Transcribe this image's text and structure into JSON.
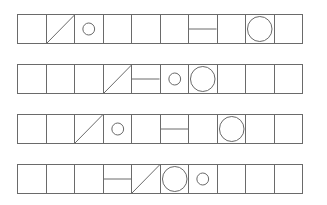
{
  "diagram": {
    "stroke_color": "#6a6a6a",
    "rows": [
      {
        "cells": [
          "empty",
          "diagonal",
          "small-circle",
          "empty",
          "empty",
          "empty",
          "horizontal-line",
          "empty",
          "large-circle",
          "empty"
        ]
      },
      {
        "cells": [
          "empty",
          "empty",
          "empty",
          "diagonal",
          "horizontal-line",
          "small-circle",
          "large-circle",
          "empty",
          "empty",
          "empty"
        ]
      },
      {
        "cells": [
          "empty",
          "empty",
          "diagonal",
          "small-circle",
          "empty",
          "horizontal-line",
          "empty",
          "large-circle",
          "empty",
          "empty"
        ]
      },
      {
        "cells": [
          "empty",
          "empty",
          "empty",
          "horizontal-line",
          "diagonal",
          "large-circle",
          "small-circle",
          "empty",
          "empty",
          "empty"
        ]
      }
    ]
  }
}
